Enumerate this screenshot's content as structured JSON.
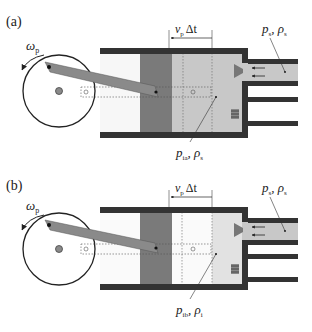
{
  "panels": [
    {
      "id": "a",
      "label": "(a)",
      "omega": "ω",
      "omega_sub": "p",
      "dim_label_v": "v",
      "dim_label_sub": "p",
      "dim_label_rest": "Δt",
      "supply_p": "p",
      "supply_p_sub": "s",
      "supply_rho": "ρ",
      "supply_rho_sub": "s",
      "chamber_p": "p",
      "chamber_p_sub": "ia",
      "chamber_rho": "ρ",
      "chamber_rho_sub": "s"
    },
    {
      "id": "b",
      "label": "(b)",
      "omega": "ω",
      "omega_sub": "p",
      "dim_label_v": "v",
      "dim_label_sub": "p",
      "dim_label_rest": "Δt",
      "supply_p": "p",
      "supply_p_sub": "s",
      "supply_rho": "ρ",
      "supply_rho_sub": "s",
      "chamber_p": "p",
      "chamber_p_sub": "ib",
      "chamber_rho": "ρ",
      "chamber_rho_sub": "i"
    }
  ],
  "colors": {
    "wall": "#333333",
    "piston": "#7a7a7a",
    "rod": "#8a8a8a",
    "fluid_a": "#c8c8c8",
    "fluid_b_light": "#e4e4e4",
    "fluid_b": "#d2d2d2",
    "empty": "#f4f4f4"
  }
}
